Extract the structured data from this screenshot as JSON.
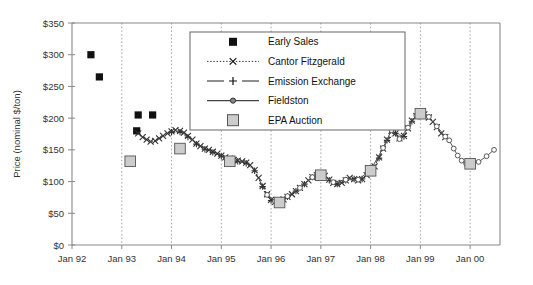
{
  "chart_data": {
    "type": "line",
    "title": "",
    "xlabel": "",
    "ylabel": "Price (nominal $/ton)",
    "ylim": [
      0,
      350
    ],
    "ytick_labels": [
      "$0",
      "$50",
      "$100",
      "$150",
      "$200",
      "$250",
      "$300",
      "$350"
    ],
    "ytick_values": [
      0,
      50,
      100,
      150,
      200,
      250,
      300,
      350
    ],
    "xtick_labels": [
      "Jan 92",
      "Jan 93",
      "Jan 94",
      "Jan 95",
      "Jan 96",
      "Jan 97",
      "Jan 98",
      "Jan 99",
      "Jan 00"
    ],
    "xtick_values": [
      1992.0,
      1993.0,
      1994.0,
      1995.0,
      1996.0,
      1997.0,
      1998.0,
      1999.0,
      2000.0
    ],
    "xlim": [
      1992.0,
      2000.6
    ],
    "grid": "vertical-dotted",
    "legend_position": "top-center-inside",
    "series": [
      {
        "name": "Early Sales",
        "marker": "filled-square",
        "line": "none",
        "color": "#111111",
        "points": [
          {
            "x": 1992.38,
            "y": 300
          },
          {
            "x": 1992.55,
            "y": 265
          },
          {
            "x": 1993.33,
            "y": 205
          },
          {
            "x": 1993.62,
            "y": 205
          },
          {
            "x": 1993.3,
            "y": 180
          }
        ]
      },
      {
        "name": "Cantor Fitzgerald",
        "marker": "x",
        "line": "dotted",
        "color": "#333333",
        "points": [
          {
            "x": 1993.33,
            "y": 176
          },
          {
            "x": 1993.42,
            "y": 170
          },
          {
            "x": 1993.5,
            "y": 166
          },
          {
            "x": 1993.58,
            "y": 163
          },
          {
            "x": 1993.67,
            "y": 164
          },
          {
            "x": 1993.75,
            "y": 168
          },
          {
            "x": 1993.83,
            "y": 172
          },
          {
            "x": 1993.92,
            "y": 176
          },
          {
            "x": 1994.0,
            "y": 179
          },
          {
            "x": 1994.08,
            "y": 181
          },
          {
            "x": 1994.17,
            "y": 180
          },
          {
            "x": 1994.25,
            "y": 177
          },
          {
            "x": 1994.33,
            "y": 172
          },
          {
            "x": 1994.42,
            "y": 166
          },
          {
            "x": 1994.5,
            "y": 160
          },
          {
            "x": 1994.58,
            "y": 156
          },
          {
            "x": 1994.67,
            "y": 152
          },
          {
            "x": 1994.75,
            "y": 150
          },
          {
            "x": 1994.83,
            "y": 147
          },
          {
            "x": 1994.92,
            "y": 144
          },
          {
            "x": 1995.0,
            "y": 141
          },
          {
            "x": 1995.08,
            "y": 138
          },
          {
            "x": 1995.17,
            "y": 136
          },
          {
            "x": 1995.25,
            "y": 134
          },
          {
            "x": 1995.33,
            "y": 133
          },
          {
            "x": 1995.42,
            "y": 132
          },
          {
            "x": 1995.5,
            "y": 130
          },
          {
            "x": 1995.58,
            "y": 126
          },
          {
            "x": 1995.67,
            "y": 118
          },
          {
            "x": 1995.75,
            "y": 106
          },
          {
            "x": 1995.83,
            "y": 93
          },
          {
            "x": 1995.92,
            "y": 80
          },
          {
            "x": 1996.0,
            "y": 71
          },
          {
            "x": 1996.08,
            "y": 68
          },
          {
            "x": 1996.17,
            "y": 69
          },
          {
            "x": 1996.25,
            "y": 72
          },
          {
            "x": 1996.33,
            "y": 76
          },
          {
            "x": 1996.42,
            "y": 80
          },
          {
            "x": 1996.5,
            "y": 85
          },
          {
            "x": 1996.58,
            "y": 90
          },
          {
            "x": 1996.67,
            "y": 96
          },
          {
            "x": 1996.75,
            "y": 102
          },
          {
            "x": 1996.83,
            "y": 107
          },
          {
            "x": 1996.92,
            "y": 110
          },
          {
            "x": 1997.0,
            "y": 112
          },
          {
            "x": 1997.08,
            "y": 109
          },
          {
            "x": 1997.17,
            "y": 103
          },
          {
            "x": 1997.25,
            "y": 98
          },
          {
            "x": 1997.33,
            "y": 96
          },
          {
            "x": 1997.42,
            "y": 98
          },
          {
            "x": 1997.5,
            "y": 102
          },
          {
            "x": 1997.58,
            "y": 106
          },
          {
            "x": 1997.67,
            "y": 104
          },
          {
            "x": 1997.75,
            "y": 102
          },
          {
            "x": 1997.83,
            "y": 104
          },
          {
            "x": 1997.92,
            "y": 110
          },
          {
            "x": 1998.0,
            "y": 117
          },
          {
            "x": 1998.08,
            "y": 124
          },
          {
            "x": 1998.17,
            "y": 138
          },
          {
            "x": 1998.25,
            "y": 152
          },
          {
            "x": 1998.33,
            "y": 166
          },
          {
            "x": 1998.42,
            "y": 180
          },
          {
            "x": 1998.5,
            "y": 176
          },
          {
            "x": 1998.58,
            "y": 168
          },
          {
            "x": 1998.67,
            "y": 172
          },
          {
            "x": 1998.75,
            "y": 184
          },
          {
            "x": 1998.83,
            "y": 196
          },
          {
            "x": 1998.92,
            "y": 203
          },
          {
            "x": 1999.0,
            "y": 207
          },
          {
            "x": 1999.08,
            "y": 206
          },
          {
            "x": 1999.17,
            "y": 201
          },
          {
            "x": 1999.25,
            "y": 194
          },
          {
            "x": 1999.33,
            "y": 186
          },
          {
            "x": 1999.42,
            "y": 176
          },
          {
            "x": 1999.5,
            "y": 170
          }
        ]
      },
      {
        "name": "Emission Exchange",
        "marker": "plus",
        "line": "dashed",
        "color": "#333333",
        "points": [
          {
            "x": 1994.0,
            "y": 178
          },
          {
            "x": 1994.17,
            "y": 178
          },
          {
            "x": 1994.33,
            "y": 170
          },
          {
            "x": 1994.5,
            "y": 159
          },
          {
            "x": 1994.67,
            "y": 151
          },
          {
            "x": 1994.83,
            "y": 146
          },
          {
            "x": 1995.0,
            "y": 140
          },
          {
            "x": 1995.17,
            "y": 135
          },
          {
            "x": 1995.33,
            "y": 132
          },
          {
            "x": 1995.5,
            "y": 129
          },
          {
            "x": 1995.67,
            "y": 117
          },
          {
            "x": 1995.83,
            "y": 92
          },
          {
            "x": 1996.0,
            "y": 70
          },
          {
            "x": 1996.17,
            "y": 69
          },
          {
            "x": 1996.33,
            "y": 76
          },
          {
            "x": 1996.5,
            "y": 85
          },
          {
            "x": 1996.67,
            "y": 96
          },
          {
            "x": 1996.83,
            "y": 107
          },
          {
            "x": 1997.0,
            "y": 112
          },
          {
            "x": 1997.17,
            "y": 102
          },
          {
            "x": 1997.33,
            "y": 96
          },
          {
            "x": 1997.5,
            "y": 102
          },
          {
            "x": 1997.67,
            "y": 104
          },
          {
            "x": 1997.83,
            "y": 104
          },
          {
            "x": 1998.0,
            "y": 117
          },
          {
            "x": 1998.17,
            "y": 137
          },
          {
            "x": 1998.33,
            "y": 165
          },
          {
            "x": 1998.5,
            "y": 176
          },
          {
            "x": 1998.67,
            "y": 171
          },
          {
            "x": 1998.83,
            "y": 195
          }
        ]
      },
      {
        "name": "Fieldston",
        "marker": "circle",
        "line": "solid",
        "color": "#555555",
        "points": [
          {
            "x": 1995.92,
            "y": 79
          },
          {
            "x": 1996.08,
            "y": 69
          },
          {
            "x": 1996.33,
            "y": 77
          },
          {
            "x": 1996.58,
            "y": 90
          },
          {
            "x": 1996.83,
            "y": 107
          },
          {
            "x": 1997.0,
            "y": 113
          },
          {
            "x": 1997.25,
            "y": 99
          },
          {
            "x": 1997.5,
            "y": 103
          },
          {
            "x": 1997.75,
            "y": 103
          },
          {
            "x": 1998.0,
            "y": 118
          },
          {
            "x": 1998.25,
            "y": 153
          },
          {
            "x": 1998.42,
            "y": 181
          },
          {
            "x": 1998.58,
            "y": 167
          },
          {
            "x": 1998.75,
            "y": 185
          },
          {
            "x": 1998.92,
            "y": 204
          },
          {
            "x": 1999.0,
            "y": 208
          },
          {
            "x": 1999.17,
            "y": 202
          },
          {
            "x": 1999.33,
            "y": 187
          },
          {
            "x": 1999.5,
            "y": 171
          },
          {
            "x": 1999.58,
            "y": 165
          },
          {
            "x": 1999.67,
            "y": 152
          },
          {
            "x": 1999.75,
            "y": 141
          },
          {
            "x": 1999.83,
            "y": 133
          },
          {
            "x": 1999.92,
            "y": 128
          },
          {
            "x": 2000.0,
            "y": 128
          },
          {
            "x": 2000.17,
            "y": 131
          },
          {
            "x": 2000.33,
            "y": 140
          },
          {
            "x": 2000.48,
            "y": 150
          }
        ]
      },
      {
        "name": "EPA Auction",
        "marker": "gray-square",
        "line": "none",
        "color": "#c8c8c8",
        "points": [
          {
            "x": 1993.17,
            "y": 132
          },
          {
            "x": 1994.17,
            "y": 152
          },
          {
            "x": 1995.17,
            "y": 132
          },
          {
            "x": 1996.17,
            "y": 67
          },
          {
            "x": 1997.0,
            "y": 110
          },
          {
            "x": 1998.0,
            "y": 117
          },
          {
            "x": 1999.0,
            "y": 207
          },
          {
            "x": 2000.0,
            "y": 128
          }
        ]
      }
    ]
  },
  "legend": {
    "entries": [
      {
        "label": "Early Sales",
        "icon": "filled-square-marker"
      },
      {
        "label": "Cantor Fitzgerald",
        "icon": "dotted-line-x-marker"
      },
      {
        "label": "Emission Exchange",
        "icon": "dashed-line-plus-marker"
      },
      {
        "label": "Fieldston",
        "icon": "solid-line-circle-marker"
      },
      {
        "label": "EPA Auction",
        "icon": "gray-square-marker"
      }
    ]
  }
}
